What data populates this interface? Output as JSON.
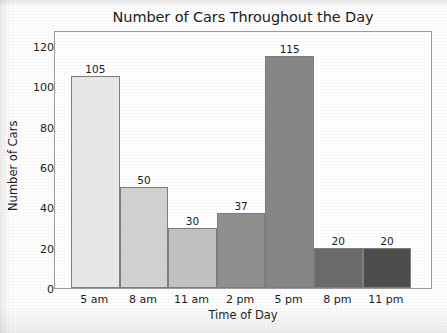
{
  "chart_data": {
    "type": "bar",
    "title": "Number of Cars Throughout the Day",
    "xlabel": "Time of Day",
    "ylabel": "Number of Cars",
    "categories": [
      "5 am",
      "8 am",
      "11 am",
      "2 pm",
      "5 pm",
      "8 pm",
      "11 pm"
    ],
    "values": [
      105,
      50,
      30,
      37,
      115,
      20,
      20
    ],
    "value_labels": [
      "105",
      "50",
      "30",
      "37",
      "115",
      "20",
      "20"
    ],
    "bar_colors": [
      "#e9e9e9",
      "#d2d2d2",
      "#c2c2c2",
      "#8f8f8f",
      "#868686",
      "#6a6a6a",
      "#4c4c4c"
    ],
    "bar_border_color": "#7d7d7d",
    "ylim": [
      0,
      120
    ],
    "yticks": [
      0,
      20,
      40,
      60,
      80,
      100,
      120
    ],
    "ytick_labels": [
      "0",
      "20",
      "40",
      "60",
      "80",
      "100",
      "120"
    ],
    "grid": false,
    "legend": false,
    "bars_adjacent": true,
    "frame_color": "#9a9a9a",
    "plot_background": "#ffffff"
  }
}
